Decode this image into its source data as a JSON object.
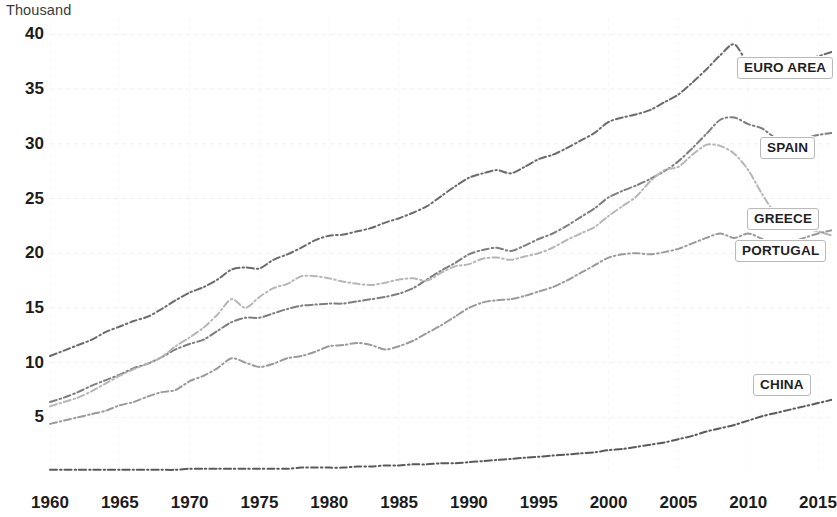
{
  "axis": {
    "unit_label": "Thousand",
    "y_ticks": [
      40,
      35,
      30,
      25,
      20,
      15,
      10,
      5
    ],
    "x_ticks": [
      1960,
      1965,
      1970,
      1975,
      1980,
      1985,
      1990,
      1995,
      2000,
      2005,
      2010,
      2015
    ]
  },
  "labels": {
    "euro_area": "EURO AREA",
    "spain": "SPAIN",
    "greece": "GREECE",
    "portugal": "PORTUGAL",
    "china": "CHINA"
  },
  "chart_data": {
    "type": "line",
    "title": "",
    "subtitle": "",
    "xlabel": "",
    "ylabel": "Thousand",
    "xlim": [
      1960,
      2016
    ],
    "ylim": [
      0,
      41.5
    ],
    "grid": true,
    "legend_position": "right-inline-labels",
    "x_tick_labels": [
      1960,
      1965,
      1970,
      1975,
      1980,
      1985,
      1990,
      1995,
      2000,
      2005,
      2010,
      2015
    ],
    "y_tick_labels": [
      5,
      10,
      15,
      20,
      25,
      30,
      35,
      40
    ],
    "x": [
      1960,
      1961,
      1962,
      1963,
      1964,
      1965,
      1966,
      1967,
      1968,
      1969,
      1970,
      1971,
      1972,
      1973,
      1974,
      1975,
      1976,
      1977,
      1978,
      1979,
      1980,
      1981,
      1982,
      1983,
      1984,
      1985,
      1986,
      1987,
      1988,
      1989,
      1990,
      1991,
      1992,
      1993,
      1994,
      1995,
      1996,
      1997,
      1998,
      1999,
      2000,
      2001,
      2002,
      2003,
      2004,
      2005,
      2006,
      2007,
      2008,
      2009,
      2010,
      2011,
      2012,
      2013,
      2014,
      2015,
      2016
    ],
    "series": [
      {
        "name": "EURO AREA",
        "color": "#6b6b6b",
        "style": "dash-dot",
        "values": [
          10.6,
          11.1,
          11.6,
          12.1,
          12.8,
          13.3,
          13.8,
          14.2,
          14.9,
          15.7,
          16.4,
          16.9,
          17.6,
          18.5,
          18.7,
          18.6,
          19.4,
          19.9,
          20.5,
          21.2,
          21.6,
          21.7,
          22.0,
          22.3,
          22.8,
          23.2,
          23.7,
          24.3,
          25.2,
          26.1,
          26.9,
          27.3,
          27.6,
          27.3,
          27.9,
          28.6,
          29.0,
          29.6,
          30.3,
          31.0,
          32.0,
          32.4,
          32.7,
          33.1,
          33.8,
          34.5,
          35.6,
          36.8,
          38.1,
          39.1,
          37.4,
          37.5,
          37.0,
          37.2,
          37.6,
          38.0,
          38.4
        ]
      },
      {
        "name": "SPAIN",
        "color": "#7e7e7e",
        "style": "dash-dot",
        "values": [
          6.4,
          6.8,
          7.3,
          7.9,
          8.4,
          8.9,
          9.5,
          9.9,
          10.5,
          11.2,
          11.7,
          12.1,
          12.9,
          13.7,
          14.1,
          14.1,
          14.5,
          14.9,
          15.2,
          15.3,
          15.4,
          15.4,
          15.6,
          15.8,
          16.0,
          16.3,
          16.8,
          17.6,
          18.4,
          19.1,
          19.9,
          20.3,
          20.5,
          20.2,
          20.7,
          21.3,
          21.8,
          22.5,
          23.3,
          24.1,
          25.1,
          25.7,
          26.2,
          26.8,
          27.5,
          28.4,
          29.6,
          30.9,
          32.2,
          32.4,
          31.8,
          31.4,
          30.5,
          30.3,
          30.5,
          30.8,
          31.0
        ]
      },
      {
        "name": "GREECE",
        "color": "#b6b6b6",
        "style": "dash-dot",
        "values": [
          6.0,
          6.4,
          6.8,
          7.4,
          8.1,
          8.8,
          9.4,
          9.9,
          10.5,
          11.5,
          12.3,
          13.2,
          14.4,
          15.8,
          15.0,
          16.0,
          16.8,
          17.2,
          17.9,
          17.9,
          17.7,
          17.4,
          17.2,
          17.1,
          17.3,
          17.6,
          17.7,
          17.5,
          18.2,
          18.8,
          19.0,
          19.5,
          19.6,
          19.4,
          19.7,
          20.0,
          20.5,
          21.2,
          21.8,
          22.4,
          23.4,
          24.3,
          25.2,
          26.6,
          27.6,
          27.9,
          29.0,
          29.9,
          29.8,
          29.1,
          27.6,
          25.4,
          23.5,
          22.6,
          22.3,
          22.0,
          21.6
        ]
      },
      {
        "name": "PORTUGAL",
        "color": "#9a9a9a",
        "style": "dash-dot",
        "values": [
          4.4,
          4.7,
          5.0,
          5.3,
          5.6,
          6.1,
          6.4,
          6.9,
          7.3,
          7.5,
          8.3,
          8.8,
          9.5,
          10.4,
          10.0,
          9.6,
          9.9,
          10.4,
          10.6,
          11.0,
          11.5,
          11.6,
          11.8,
          11.6,
          11.2,
          11.5,
          12.0,
          12.7,
          13.4,
          14.2,
          15.0,
          15.5,
          15.7,
          15.8,
          16.1,
          16.5,
          16.9,
          17.5,
          18.2,
          18.9,
          19.6,
          19.9,
          20.0,
          19.9,
          20.1,
          20.4,
          20.9,
          21.4,
          21.8,
          21.4,
          21.8,
          21.3,
          20.7,
          21.0,
          21.4,
          21.8,
          22.1
        ]
      },
      {
        "name": "CHINA",
        "color": "#5a5a5a",
        "style": "dash-dot",
        "values": [
          0.2,
          0.2,
          0.2,
          0.2,
          0.2,
          0.2,
          0.2,
          0.2,
          0.2,
          0.2,
          0.3,
          0.3,
          0.3,
          0.3,
          0.3,
          0.3,
          0.3,
          0.3,
          0.4,
          0.4,
          0.4,
          0.4,
          0.5,
          0.5,
          0.6,
          0.6,
          0.7,
          0.7,
          0.8,
          0.8,
          0.9,
          1.0,
          1.1,
          1.2,
          1.3,
          1.4,
          1.5,
          1.6,
          1.7,
          1.8,
          2.0,
          2.1,
          2.3,
          2.5,
          2.7,
          3.0,
          3.3,
          3.7,
          4.0,
          4.3,
          4.7,
          5.1,
          5.4,
          5.7,
          6.0,
          6.3,
          6.6
        ]
      }
    ],
    "annotations": [
      {
        "text": "EURO AREA",
        "series": "EURO AREA",
        "at_x": 2016,
        "at_y": 38.4
      },
      {
        "text": "SPAIN",
        "series": "SPAIN",
        "at_x": 2016,
        "at_y": 31.0
      },
      {
        "text": "GREECE",
        "series": "GREECE",
        "at_x": 2016,
        "at_y": 21.6
      },
      {
        "text": "PORTUGAL",
        "series": "PORTUGAL",
        "at_x": 2016,
        "at_y": 22.1
      },
      {
        "text": "CHINA",
        "series": "CHINA",
        "at_x": 2016,
        "at_y": 6.6
      }
    ]
  },
  "label_positions": {
    "euro_area": {
      "left": 737,
      "top": 68
    },
    "spain": {
      "left": 760,
      "top": 148
    },
    "greece": {
      "left": 747,
      "top": 219
    },
    "portugal": {
      "left": 735,
      "top": 251
    },
    "china": {
      "left": 753,
      "top": 385
    }
  }
}
